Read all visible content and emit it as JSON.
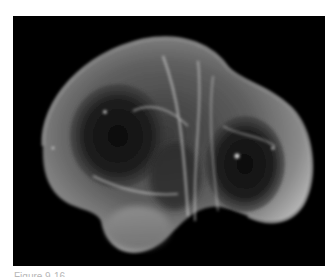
{
  "page": {
    "background": "#ffffff"
  },
  "figure": {
    "background_color": "#000000"
  },
  "caption": {
    "text": "Figure 9-16  ...",
    "visibility": "partially cropped at bottom edge"
  }
}
